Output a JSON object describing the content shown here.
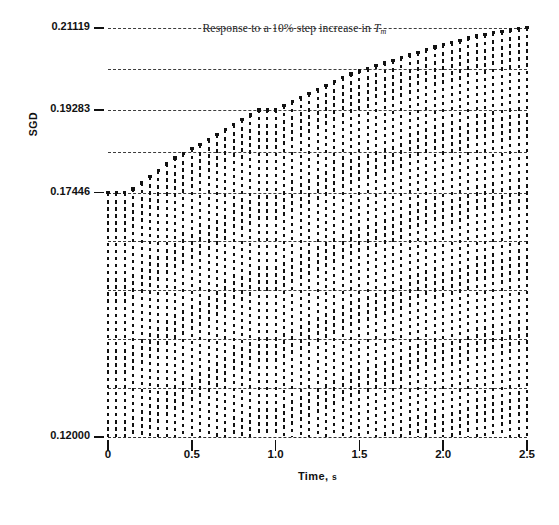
{
  "figure": {
    "title_prefix": "Response to a ",
    "title_pct": "10%",
    "title_mid": " step increase in ",
    "title_var": "T",
    "title_var_sub": "m",
    "title_full": "Response to a 10% step increase in Tm"
  },
  "axes": {
    "y_title": "SGD",
    "x_title": "Time,",
    "x_unit": "s",
    "y_tick_labels": [
      "0.21119",
      "0.19283",
      "0.17446",
      "0.12000"
    ],
    "x_tick_labels": [
      "0",
      "0.5",
      "1.0",
      "1.5",
      "2.0",
      "2.5"
    ]
  },
  "chart_data": {
    "type": "bar",
    "title": "Response to a 10% step increase in Tm",
    "xlabel": "Time, s",
    "ylabel": "SGD",
    "xlim": [
      0,
      2.5
    ],
    "ylim": [
      0.12,
      0.21119
    ],
    "grid": true,
    "legend": null,
    "y_ticks": [
      0.12,
      0.17446,
      0.19283,
      0.21119
    ],
    "y_tick_labels": [
      "0.12000",
      "0.17446",
      "0.19283",
      "0.21119"
    ],
    "x_ticks": [
      0,
      0.5,
      1.0,
      1.5,
      2.0,
      2.5
    ],
    "x_tick_labels": [
      "0",
      "0.5",
      "1.0",
      "1.5",
      "2.0",
      "2.5"
    ],
    "gridlines_y": [
      0.13091,
      0.14182,
      0.15273,
      0.16364,
      0.17446,
      0.18364,
      0.19283,
      0.20201,
      0.21119
    ],
    "baseline": 0.12,
    "series": [
      {
        "name": "SGD step response",
        "style": "dotted-vertical-columns",
        "x": [
          0.0,
          0.05,
          0.1,
          0.15,
          0.2,
          0.25,
          0.3,
          0.35,
          0.4,
          0.45,
          0.5,
          0.55,
          0.6,
          0.65,
          0.7,
          0.75,
          0.8,
          0.85,
          0.9,
          0.95,
          1.0,
          1.05,
          1.1,
          1.15,
          1.2,
          1.25,
          1.3,
          1.35,
          1.4,
          1.45,
          1.5,
          1.55,
          1.6,
          1.65,
          1.7,
          1.75,
          1.8,
          1.85,
          1.9,
          1.95,
          2.0,
          2.05,
          2.1,
          2.15,
          2.2,
          2.25,
          2.3,
          2.35,
          2.4,
          2.45,
          2.5
        ],
        "values": [
          0.17446,
          0.17446,
          0.17446,
          0.1752,
          0.1766,
          0.178,
          0.1794,
          0.1808,
          0.1821,
          0.1832,
          0.1842,
          0.1852,
          0.1863,
          0.1874,
          0.1885,
          0.1896,
          0.1907,
          0.1917,
          0.19283,
          0.19283,
          0.19283,
          0.1938,
          0.1947,
          0.1956,
          0.1965,
          0.1974,
          0.1983,
          0.1992,
          0.2001,
          0.2009,
          0.2015,
          0.2021,
          0.2027,
          0.2033,
          0.2039,
          0.2045,
          0.2051,
          0.2057,
          0.2063,
          0.2069,
          0.2074,
          0.2079,
          0.2084,
          0.2089,
          0.2093,
          0.2097,
          0.2101,
          0.2104,
          0.2107,
          0.211,
          0.21119
        ]
      }
    ]
  }
}
